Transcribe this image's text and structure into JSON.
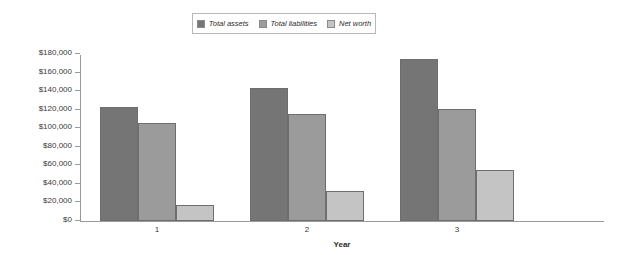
{
  "chart_data": {
    "type": "bar",
    "title": "",
    "xlabel": "Year",
    "ylabel": "",
    "categories": [
      "1",
      "2",
      "3"
    ],
    "series": [
      {
        "name": "Total assets",
        "values": [
          123000,
          143000,
          175000
        ],
        "color": "#757575"
      },
      {
        "name": "Total liabilities",
        "values": [
          106000,
          115000,
          121000
        ],
        "color": "#9b9b9b"
      },
      {
        "name": "Net worth",
        "values": [
          17000,
          32000,
          55000
        ],
        "color": "#c4c4c4"
      }
    ],
    "ylim": [
      0,
      180000
    ],
    "ytick_values": [
      0,
      20000,
      40000,
      60000,
      80000,
      100000,
      120000,
      140000,
      160000,
      180000
    ],
    "ytick_labels": [
      "$0",
      "$20,000",
      "$40,000",
      "$60,000",
      "$80,000",
      "$100,000",
      "$120,000",
      "$140,000",
      "$160,000",
      "$180,000"
    ],
    "grid": false,
    "legend_position": "top-center",
    "axis_color": "#9a9a9a",
    "bar_border_color": "#6e6e6e",
    "background": "#ffffff"
  }
}
